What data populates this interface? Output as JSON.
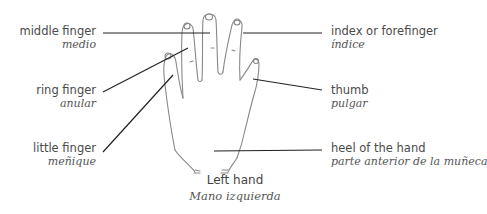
{
  "labels": {
    "middle_finger": {
      "en": "middle finger",
      "es": "medio"
    },
    "index_finger": {
      "en": "index or forefinger",
      "es": "índice"
    },
    "ring_finger": {
      "en": "ring finger",
      "es": "anular"
    },
    "thumb": {
      "en": "thumb",
      "es": "pulgar"
    },
    "little_finger": {
      "en": "little finger",
      "es": "meñique"
    },
    "heel_of_hand": {
      "en": "heel of the hand",
      "es": "parte anterior de la muñeca"
    }
  },
  "caption": {
    "en": "Left hand",
    "es": "Mano izquierda"
  },
  "colors": {
    "line": "#222222",
    "sketch": "#777777",
    "text": "#4a4a4a"
  }
}
